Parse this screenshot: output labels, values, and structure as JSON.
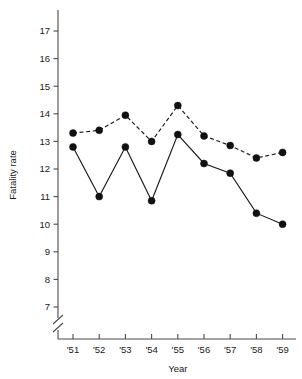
{
  "chart_data": {
    "type": "line",
    "title": "",
    "xlabel": "Year",
    "ylabel": "Fatality rate",
    "categories": [
      "'51",
      "'52",
      "'53",
      "'54",
      "'55",
      "'56",
      "'57",
      "'58",
      "'59"
    ],
    "x_tick_labels": [
      "'51",
      "'52",
      "'53",
      "'54",
      "'55",
      "'56",
      "'57",
      "'58",
      "'59"
    ],
    "y_tick_labels": [
      "7",
      "8",
      "9",
      "10",
      "11",
      "12",
      "13",
      "14",
      "15",
      "16",
      "17"
    ],
    "y_ticks": [
      7,
      8,
      9,
      10,
      11,
      12,
      13,
      14,
      15,
      16,
      17
    ],
    "ylim": [
      7,
      17
    ],
    "y_axis_break": true,
    "y_axis_break_note": "axis broken below 7",
    "grid": false,
    "legend": "none",
    "series": [
      {
        "name": "dashed-series",
        "style": "dashed",
        "marker": "filled-circle",
        "values": [
          13.3,
          13.4,
          13.95,
          13.0,
          14.3,
          13.2,
          12.85,
          12.4,
          12.6
        ]
      },
      {
        "name": "solid-series",
        "style": "solid",
        "marker": "filled-circle",
        "values": [
          12.8,
          11.0,
          12.8,
          10.85,
          13.25,
          12.2,
          11.85,
          10.4,
          10.0
        ]
      }
    ],
    "colors": {
      "line": "#1a1a1a",
      "marker": "#111111",
      "axis": "#4a4a4a",
      "background": "#ffffff"
    }
  }
}
